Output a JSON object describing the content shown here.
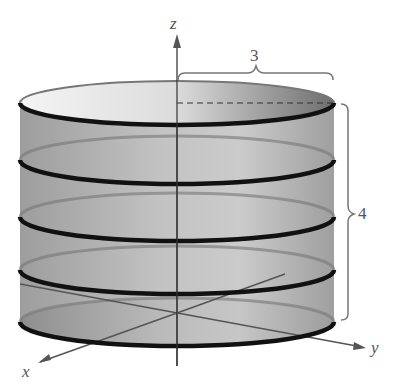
{
  "figure": {
    "type": "3D cylinder with horizontal cross-section rings",
    "axes": {
      "x": "x",
      "y": "y",
      "z": "z"
    },
    "radius_label": "3",
    "height_label": "4",
    "ring_count": 5
  },
  "colors": {
    "surface": "#8a8a8a",
    "ring": "#111111",
    "axis": "#555555"
  }
}
